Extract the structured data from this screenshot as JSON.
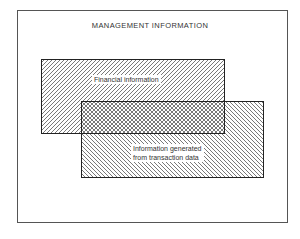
{
  "diagram": {
    "title": "MANAGEMENT INFORMATION",
    "sets": [
      {
        "id": "financial",
        "label": "Financial information",
        "hatch": "forward-diagonal",
        "bounds": {
          "x": 41,
          "y": 59,
          "w": 183,
          "h": 74
        }
      },
      {
        "id": "transaction",
        "label_lines": [
          "Information generated",
          "from transaction data"
        ],
        "hatch": "backward-diagonal",
        "bounds": {
          "x": 81,
          "y": 101,
          "w": 182,
          "h": 76
        }
      }
    ],
    "overlap": {
      "hatch": "cross-hatch",
      "bounds": {
        "x": 81,
        "y": 101,
        "w": 143,
        "h": 32
      }
    },
    "colors": {
      "frame": "#555555",
      "hatch": "#666666",
      "outline": "#222222",
      "background": "#ffffff"
    }
  }
}
